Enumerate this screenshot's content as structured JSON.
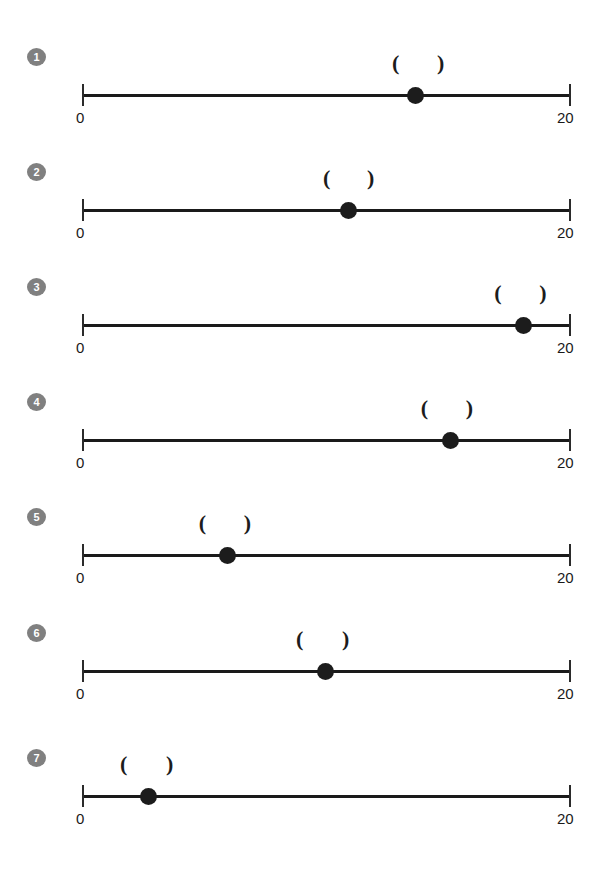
{
  "page": {
    "background": "#ffffff",
    "width": 606,
    "height": 869,
    "accent_gray": "#808080",
    "mark_color": "#1c1c1c"
  },
  "axis": {
    "min_label": "0",
    "max_label": "20",
    "min_value": 0,
    "max_value": 20
  },
  "rows": [
    {
      "badge": "1",
      "top": 48,
      "point_pct": 68.2,
      "open_paren": "(",
      "close_paren": ")",
      "open_pct": 64.2,
      "close_pct": 73.4,
      "point_value": 13.6,
      "interval_low": 12.8,
      "interval_high": 14.7
    },
    {
      "badge": "2",
      "top": 163,
      "point_pct": 54.6,
      "open_paren": "(",
      "close_paren": ")",
      "open_pct": 50.1,
      "close_pct": 59.1,
      "point_value": 10.9,
      "interval_low": 10.0,
      "interval_high": 11.8
    },
    {
      "badge": "3",
      "top": 278,
      "point_pct": 90.2,
      "open_paren": "(",
      "close_paren": ")",
      "open_pct": 85.1,
      "close_pct": 94.3,
      "point_value": 18.0,
      "interval_low": 17.0,
      "interval_high": 18.9
    },
    {
      "badge": "4",
      "top": 393,
      "point_pct": 75.3,
      "open_paren": "(",
      "close_paren": ")",
      "open_pct": 70.1,
      "close_pct": 79.3,
      "point_value": 15.1,
      "interval_low": 14.0,
      "interval_high": 15.9
    },
    {
      "badge": "5",
      "top": 508,
      "point_pct": 29.7,
      "open_paren": "(",
      "close_paren": ")",
      "open_pct": 24.7,
      "close_pct": 33.9,
      "point_value": 5.9,
      "interval_low": 4.9,
      "interval_high": 6.8
    },
    {
      "badge": "6",
      "top": 624,
      "point_pct": 49.7,
      "open_paren": "(",
      "close_paren": ")",
      "open_pct": 44.6,
      "close_pct": 54.0,
      "point_value": 9.9,
      "interval_low": 8.9,
      "interval_high": 10.8
    },
    {
      "badge": "7",
      "top": 749,
      "point_pct": 13.5,
      "open_paren": "(",
      "close_paren": ")",
      "open_pct": 8.6,
      "close_pct": 18.0,
      "point_value": 2.7,
      "interval_low": 1.7,
      "interval_high": 3.6
    }
  ],
  "chart_data": {
    "type": "scatter",
    "title": "",
    "xlabel": "",
    "ylabel": "",
    "xlim": [
      0,
      20
    ],
    "grid": false,
    "legend": "none",
    "tick_labels": [
      "0",
      "20"
    ],
    "annotations": [
      "(",
      ")"
    ],
    "series": [
      {
        "name": "1",
        "x": 13.6,
        "interval": [
          12.8,
          14.7
        ]
      },
      {
        "name": "2",
        "x": 10.9,
        "interval": [
          10.0,
          11.8
        ]
      },
      {
        "name": "3",
        "x": 18.0,
        "interval": [
          17.0,
          18.9
        ]
      },
      {
        "name": "4",
        "x": 15.1,
        "interval": [
          14.0,
          15.9
        ]
      },
      {
        "name": "5",
        "x": 5.9,
        "interval": [
          4.9,
          6.8
        ]
      },
      {
        "name": "6",
        "x": 9.9,
        "interval": [
          8.9,
          10.8
        ]
      },
      {
        "name": "7",
        "x": 2.7,
        "interval": [
          1.7,
          3.6
        ]
      }
    ]
  }
}
